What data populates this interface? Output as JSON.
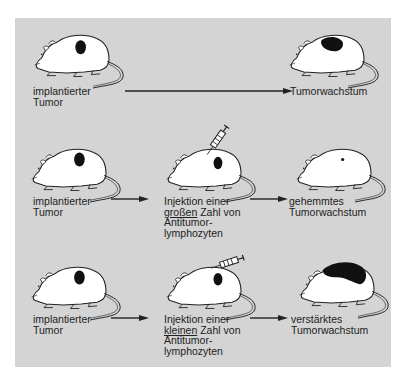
{
  "colors": {
    "panel": "#d4d4d4",
    "mouse_fill": "#ffffff",
    "outline": "#222222",
    "tumor": "#111111"
  },
  "rows": [
    {
      "start": {
        "lines": [
          "implantierter",
          "Tumor"
        ],
        "tumor_size": "medium"
      },
      "result": {
        "lines": [
          "Tumorwachstum"
        ],
        "tumor_size": "large"
      }
    },
    {
      "start": {
        "lines": [
          "implantierter",
          "Tumor"
        ],
        "tumor_size": "medium"
      },
      "treatment": {
        "line1": "Injektion einer",
        "line2_underlined": "großen",
        "line2_rest": " Zahl von",
        "line3": "Antitumor-",
        "line4": "lymphozyten",
        "syringe": "vertical"
      },
      "result": {
        "lines": [
          "gehemmtes",
          "Tumorwachstum"
        ],
        "tumor_size": "tiny"
      }
    },
    {
      "start": {
        "lines": [
          "implantierter",
          "Tumor"
        ],
        "tumor_size": "medium"
      },
      "treatment": {
        "line1": "Injektion einer",
        "line2_underlined": "kleinen",
        "line2_rest": " Zahl von",
        "line3": "Antitumor-",
        "line4": "lymphozyten",
        "syringe": "horizontal"
      },
      "result": {
        "lines": [
          "verstärktes",
          "Tumorwachstum"
        ],
        "tumor_size": "huge"
      }
    }
  ]
}
